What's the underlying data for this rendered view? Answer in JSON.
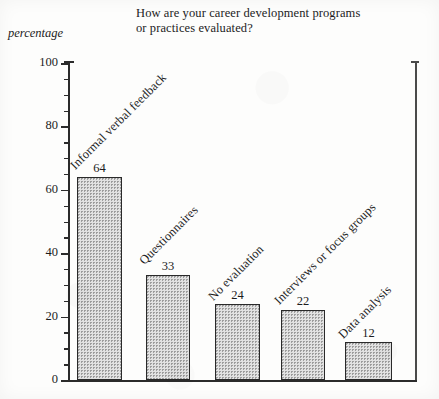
{
  "chart_data": {
    "type": "bar",
    "title": "How are your career development programs or practices evaluated?",
    "title_lines": [
      "How are your career development programs",
      "or practices evaluated?"
    ],
    "xlabel": "",
    "ylabel": "percentage",
    "ylim": [
      0,
      100
    ],
    "ytick_labels": [
      "0",
      "20",
      "40",
      "60",
      "80",
      "100"
    ],
    "ytick_values": [
      0,
      20,
      40,
      60,
      80,
      100
    ],
    "minor_tick_step": 5,
    "grid": false,
    "legend": "none",
    "categories": [
      "Informal verbal feedback",
      "Questionnaires",
      "No evaluation",
      "Interviews or focus groups",
      "Data analysis"
    ],
    "values": [
      64,
      33,
      24,
      22,
      12
    ],
    "value_labels": [
      "64",
      "33",
      "24",
      "22",
      "12"
    ],
    "bar_color": "#e2e2e2",
    "bar_edge_color": "#2a2a2a",
    "axis_color": "#2b2b2b",
    "background_color": "#fdfdfc"
  }
}
